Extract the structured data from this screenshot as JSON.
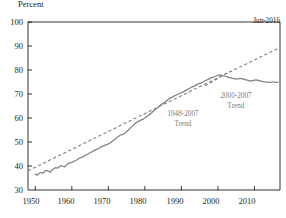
{
  "chart_data": {
    "type": "line",
    "title": "",
    "ylabel": "Percent",
    "xlabel": "",
    "ylim": [
      30,
      100
    ],
    "xlim": [
      1948,
      2017
    ],
    "yticks": [
      30,
      40,
      50,
      60,
      70,
      80,
      90,
      100
    ],
    "xticks": [
      1950,
      1960,
      1970,
      1980,
      1990,
      2000,
      2010
    ],
    "grid": false,
    "legend": "none",
    "annotations": [
      {
        "name": "latest-date",
        "text": "Jun-2016"
      },
      {
        "name": "long-trend-label",
        "text_line1": "1948-2007",
        "text_line2": "Trend"
      },
      {
        "name": "short-trend-label",
        "text_line1": "2000-2007",
        "text_line2": "Trend"
      }
    ],
    "series": [
      {
        "name": "Index level",
        "style": "solid",
        "color": "#808080",
        "x": [
          1950.0,
          1950.5,
          1951.0,
          1951.5,
          1952.0,
          1952.5,
          1953.0,
          1953.5,
          1954.0,
          1954.5,
          1955.0,
          1955.5,
          1956.0,
          1956.5,
          1957.0,
          1957.5,
          1958.0,
          1958.5,
          1959.0,
          1959.5,
          1960.0,
          1960.5,
          1961.0,
          1961.5,
          1962.0,
          1962.5,
          1963.0,
          1963.5,
          1964.0,
          1964.5,
          1965.0,
          1965.5,
          1966.0,
          1966.5,
          1967.0,
          1967.5,
          1968.0,
          1968.5,
          1969.0,
          1969.5,
          1970.0,
          1970.5,
          1971.0,
          1971.5,
          1972.0,
          1972.5,
          1973.0,
          1973.5,
          1974.0,
          1974.5,
          1975.0,
          1975.5,
          1976.0,
          1976.5,
          1977.0,
          1977.5,
          1978.0,
          1978.5,
          1979.0,
          1979.5,
          1980.0,
          1980.5,
          1981.0,
          1981.5,
          1982.0,
          1982.5,
          1983.0,
          1983.5,
          1984.0,
          1984.5,
          1985.0,
          1985.5,
          1986.0,
          1986.5,
          1987.0,
          1987.5,
          1988.0,
          1988.5,
          1989.0,
          1989.5,
          1990.0,
          1990.5,
          1991.0,
          1991.5,
          1992.0,
          1992.5,
          1993.0,
          1993.5,
          1994.0,
          1994.5,
          1995.0,
          1995.5,
          1996.0,
          1996.5,
          1997.0,
          1997.5,
          1998.0,
          1998.5,
          1999.0,
          1999.5,
          2000.0,
          2000.5,
          2001.0,
          2001.5,
          2002.0,
          2002.5,
          2003.0,
          2003.5,
          2004.0,
          2004.5,
          2005.0,
          2005.5,
          2006.0,
          2006.5,
          2007.0,
          2007.5,
          2008.0,
          2008.5,
          2009.0,
          2009.5,
          2010.0,
          2010.5,
          2011.0,
          2011.5,
          2012.0,
          2012.5,
          2013.0,
          2013.5,
          2014.0,
          2014.5,
          2015.0,
          2015.5,
          2016.0,
          2016.45
        ],
        "y": [
          36.6,
          36.2,
          36.9,
          37.3,
          37.0,
          37.6,
          38.2,
          37.9,
          37.4,
          38.1,
          38.8,
          39.3,
          39.1,
          39.6,
          40.2,
          39.9,
          39.6,
          40.4,
          41.0,
          41.3,
          41.5,
          41.9,
          42.3,
          42.6,
          43.2,
          43.5,
          43.8,
          44.2,
          44.7,
          45.1,
          45.5,
          45.9,
          46.4,
          46.7,
          47.0,
          47.4,
          47.9,
          48.3,
          48.6,
          48.9,
          49.2,
          49.6,
          50.2,
          50.8,
          51.4,
          52.0,
          52.6,
          53.0,
          53.2,
          53.6,
          54.3,
          55.0,
          55.8,
          56.5,
          57.2,
          57.9,
          58.4,
          58.8,
          59.2,
          59.5,
          60.0,
          60.6,
          61.2,
          61.6,
          62.4,
          63.1,
          63.8,
          64.3,
          65.0,
          65.6,
          66.1,
          66.6,
          67.2,
          67.8,
          68.3,
          68.7,
          69.1,
          69.5,
          69.9,
          70.2,
          70.6,
          70.9,
          71.3,
          71.7,
          72.2,
          72.6,
          73.0,
          73.3,
          73.7,
          74.1,
          74.4,
          74.7,
          75.1,
          75.5,
          75.9,
          76.2,
          76.6,
          76.9,
          77.2,
          77.5,
          77.8,
          78.0,
          77.8,
          77.6,
          77.4,
          77.1,
          76.9,
          76.7,
          76.5,
          76.4,
          76.2,
          76.3,
          76.5,
          76.4,
          76.2,
          76.0,
          75.8,
          75.6,
          75.4,
          75.6,
          75.8,
          75.9,
          75.7,
          75.5,
          75.3,
          75.2,
          75.0,
          74.9,
          74.8,
          74.9,
          75.1,
          75.0,
          74.8,
          74.9
        ]
      },
      {
        "name": "1948-2007 Trend",
        "style": "dashed",
        "color": "#808080",
        "x": [
          1948,
          2016.45
        ],
        "y": [
          38.0,
          89.0
        ]
      },
      {
        "name": "2000-2007 Trend",
        "style": "dashed",
        "color": "#808080",
        "x": [
          1996.5,
          2003.5
        ],
        "y": [
          73.4,
          79.6
        ]
      }
    ]
  },
  "axis": {
    "y_title": "Percent",
    "y_labels": [
      "100",
      "90",
      "80",
      "70",
      "60",
      "50",
      "40",
      "30"
    ],
    "x_labels": [
      "1950",
      "1960",
      "1970",
      "1980",
      "1990",
      "2000",
      "2010"
    ]
  },
  "labels": {
    "latest_date": "Jun-2016",
    "long_trend_line1": "1948-2007",
    "long_trend_line2": "Trend",
    "short_trend_line1": "2000-2007",
    "short_trend_line2": "Trend"
  },
  "colors": {
    "series": "#808080",
    "trend": "#8a8a8a",
    "axis": "#000000",
    "annotation_text": "#7a7a7a"
  }
}
